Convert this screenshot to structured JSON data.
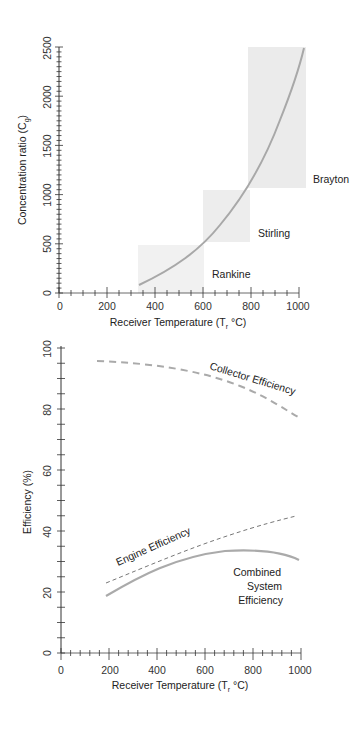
{
  "chart_data": [
    {
      "type": "line",
      "title": "",
      "xlabel": "Receiver Temperature (T_r °C)",
      "ylabel": "Concentration ratio (C_g)",
      "xlim": [
        0,
        1000
      ],
      "ylim": [
        0,
        2500
      ],
      "x_ticks": [
        "0",
        "200",
        "400",
        "600",
        "800",
        "1000"
      ],
      "y_ticks": [
        "0",
        "500",
        "1000",
        "1500",
        "2000",
        "2500"
      ],
      "grid": false,
      "series": [
        {
          "name": "Concentration ratio",
          "x": [
            330,
            400,
            500,
            600,
            700,
            800,
            900,
            1000
          ],
          "y": [
            80,
            200,
            350,
            520,
            750,
            1080,
            1650,
            2500
          ]
        }
      ],
      "regions": [
        {
          "name": "Rankine",
          "x": [
            330,
            600
          ],
          "y": [
            0,
            500
          ]
        },
        {
          "name": "Stirling",
          "x": [
            600,
            800
          ],
          "y": [
            500,
            1050
          ]
        },
        {
          "name": "Brayton",
          "x": [
            800,
            1020
          ],
          "y": [
            1050,
            2500
          ]
        }
      ]
    },
    {
      "type": "line",
      "title": "",
      "xlabel": "Receiver Temperature (T_r °C)",
      "ylabel": "Efficiency (%)",
      "xlim": [
        0,
        1000
      ],
      "ylim": [
        0,
        100
      ],
      "x_ticks": [
        "0",
        "200",
        "400",
        "600",
        "800",
        "1000"
      ],
      "y_ticks": [
        "0",
        "20",
        "40",
        "60",
        "80",
        "100"
      ],
      "grid": false,
      "series": [
        {
          "name": "Collector Efficiency",
          "style": "dashed",
          "x": [
            150,
            300,
            500,
            700,
            850,
            1000
          ],
          "y": [
            95,
            94,
            91,
            87,
            82,
            76
          ]
        },
        {
          "name": "Engine Efficiency",
          "style": "dashed",
          "x": [
            150,
            300,
            500,
            700,
            850,
            1000
          ],
          "y": [
            22,
            28,
            34,
            39,
            42,
            44
          ]
        },
        {
          "name": "Combined System Efficiency",
          "style": "solid",
          "x": [
            150,
            300,
            500,
            700,
            850,
            1000
          ],
          "y": [
            18,
            25,
            31,
            33,
            32,
            30
          ]
        }
      ]
    }
  ],
  "top": {
    "ylabel": "Concentration ratio (C",
    "ylabel_sub": "g",
    "ylabel_end": ")",
    "xlabel_a": "Receiver Temperature (T",
    "xlabel_sub": "r",
    "xlabel_b": " °C)",
    "regions": {
      "rankine": "Rankine",
      "stirling": "Stirling",
      "brayton": "Brayton"
    }
  },
  "bottom": {
    "ylabel": "Efficiency (%)",
    "xlabel_a": "Receiver Temperature (T",
    "xlabel_sub": "r",
    "xlabel_b": " °C)",
    "labels": {
      "collector": "Collector Efficiency",
      "engine": "Engine Efficiency",
      "combined_1": "Combined",
      "combined_2": "System",
      "combined_3": "Efficiency"
    }
  },
  "colors": {
    "curve": "#a9a9a9",
    "region": "#ececec",
    "axis": "#333333"
  }
}
